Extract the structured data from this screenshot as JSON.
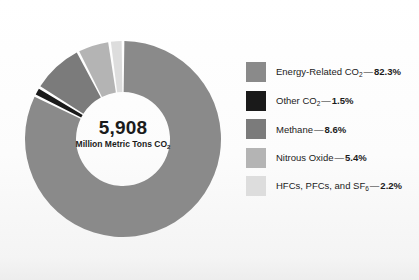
{
  "chart_data": {
    "type": "pie",
    "variant": "donut",
    "title": "",
    "subtitle": "",
    "xlabel": "",
    "ylabel": "",
    "grid": false,
    "legend_position": "right",
    "start_angle_deg": 0,
    "direction": "clockwise",
    "units": "percent",
    "total_value": "5,908",
    "total_units_text": "Million Metric Tons CO",
    "total_units_subscript": "2",
    "categories": [
      "Energy-Related CO2",
      "Other CO2",
      "Methane",
      "Nitrous Oxide",
      "HFCs, PFCs, and SF6"
    ],
    "values": [
      82.3,
      1.5,
      8.6,
      5.4,
      2.2
    ],
    "colors": [
      "#8a8a8a",
      "#1a1a1a",
      "#7b7b7b",
      "#b4b4b4",
      "#dddddd"
    ]
  },
  "center": {
    "value": "5,908",
    "units_prefix": "Million Metric Tons CO",
    "units_subscript": "2"
  },
  "legend": {
    "items": [
      {
        "name": "energy-related-co2",
        "label_prefix": "Energy-Related CO",
        "label_subscript": "2",
        "label_suffix": "",
        "dash": "—",
        "percent": "82.3%",
        "color": "#8a8a8a"
      },
      {
        "name": "other-co2",
        "label_prefix": "Other CO",
        "label_subscript": "2",
        "label_suffix": "",
        "dash": "—",
        "percent": "1.5%",
        "color": "#1a1a1a"
      },
      {
        "name": "methane",
        "label_prefix": "Methane",
        "label_subscript": "",
        "label_suffix": "",
        "dash": "—",
        "percent": "8.6%",
        "color": "#7b7b7b"
      },
      {
        "name": "nitrous-oxide",
        "label_prefix": "Nitrous Oxide",
        "label_subscript": "",
        "label_suffix": "",
        "dash": "—",
        "percent": "5.4%",
        "color": "#b4b4b4"
      },
      {
        "name": "hfcs-pfcs-sf6",
        "label_prefix": "HFCs, PFCs, and SF",
        "label_subscript": "6",
        "label_suffix": "",
        "dash": "—",
        "percent": "2.2%",
        "color": "#dddddd"
      }
    ]
  }
}
